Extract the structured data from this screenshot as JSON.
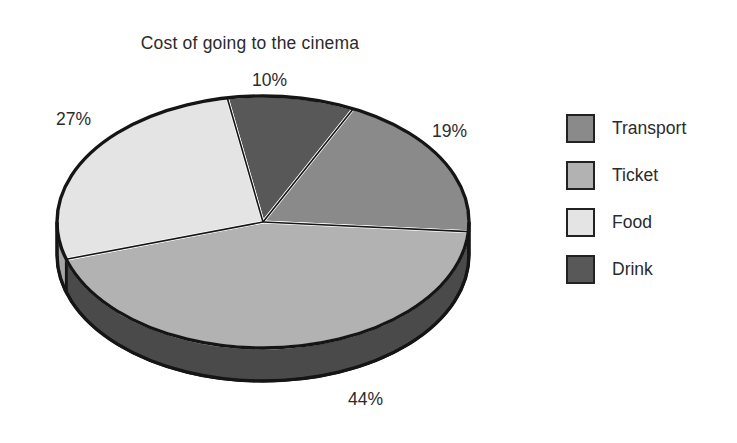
{
  "chart_data": {
    "type": "pie",
    "title": "Cost of going to the cinema",
    "categories": [
      "Transport",
      "Ticket",
      "Food",
      "Drink"
    ],
    "values": [
      19,
      44,
      27,
      10
    ],
    "value_unit": "%",
    "data_labels": [
      "19%",
      "44%",
      "27%",
      "10%"
    ],
    "colors": [
      "#8a8a8a",
      "#b2b2b2",
      "#e4e4e4",
      "#585858"
    ],
    "legend_position": "right",
    "grid": false,
    "three_d": true,
    "start_angle_deg": -10,
    "direction": "clockwise",
    "slices": [
      {
        "name": "Drink",
        "value": 10,
        "label": "10%",
        "color": "#585858",
        "side_color": "#3e3e3e"
      },
      {
        "name": "Transport",
        "value": 19,
        "label": "19%",
        "color": "#8a8a8a",
        "side_color": "#636363"
      },
      {
        "name": "Ticket",
        "value": 44,
        "label": "44%",
        "color": "#b2b2b2",
        "side_color": "#4a4a4a"
      },
      {
        "name": "Food",
        "value": 27,
        "label": "27%",
        "color": "#e4e4e4",
        "side_color": "#a5a5a5"
      }
    ]
  },
  "title": {
    "text": "Cost of going to the cinema"
  },
  "labels": {
    "drink_pct": "10%",
    "transport_pct": "19%",
    "food_pct": "27%",
    "ticket_pct": "44%"
  },
  "legend": {
    "items": [
      {
        "label": "Transport",
        "color": "#8a8a8a"
      },
      {
        "label": "Ticket",
        "color": "#b2b2b2"
      },
      {
        "label": "Food",
        "color": "#e4e4e4"
      },
      {
        "label": "Drink",
        "color": "#585858"
      }
    ]
  }
}
